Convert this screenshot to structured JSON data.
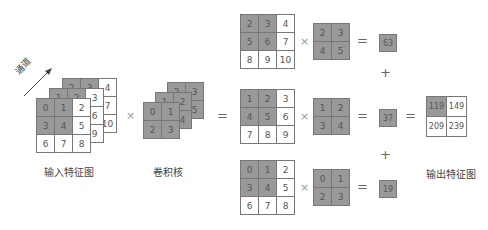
{
  "labels": {
    "input": "输入特征图",
    "kernel": "卷积核",
    "output": "输出特征图",
    "channel": "通道"
  },
  "operators": {
    "times": "×",
    "equals": "=",
    "plus": "+"
  },
  "input_channels": [
    [
      [
        0,
        1,
        2
      ],
      [
        3,
        4,
        5
      ],
      [
        6,
        7,
        8
      ]
    ],
    [
      [
        1,
        2,
        3
      ],
      [
        4,
        5,
        6
      ],
      [
        7,
        8,
        9
      ]
    ],
    [
      [
        2,
        3,
        4
      ],
      [
        5,
        6,
        7
      ],
      [
        8,
        9,
        10
      ]
    ]
  ],
  "kernel_channels": [
    [
      [
        0,
        1
      ],
      [
        2,
        3
      ]
    ],
    [
      [
        1,
        2
      ],
      [
        3,
        4
      ]
    ],
    [
      [
        2,
        3
      ],
      [
        4,
        5
      ]
    ]
  ],
  "rows": [
    {
      "input": [
        [
          2,
          3,
          4
        ],
        [
          5,
          6,
          7
        ],
        [
          8,
          9,
          10
        ]
      ],
      "kernel": [
        [
          2,
          3
        ],
        [
          4,
          5
        ]
      ],
      "result": "63"
    },
    {
      "input": [
        [
          1,
          2,
          3
        ],
        [
          4,
          5,
          6
        ],
        [
          7,
          8,
          9
        ]
      ],
      "kernel": [
        [
          1,
          2
        ],
        [
          3,
          4
        ]
      ],
      "result": "37"
    },
    {
      "input": [
        [
          0,
          1,
          2
        ],
        [
          3,
          4,
          5
        ],
        [
          6,
          7,
          8
        ]
      ],
      "kernel": [
        [
          0,
          1
        ],
        [
          2,
          3
        ]
      ],
      "result": "19"
    }
  ],
  "output": [
    [
      "119",
      "149"
    ],
    [
      "209",
      "239"
    ]
  ],
  "colors": {
    "highlight": "#999999",
    "border": "#777777"
  }
}
